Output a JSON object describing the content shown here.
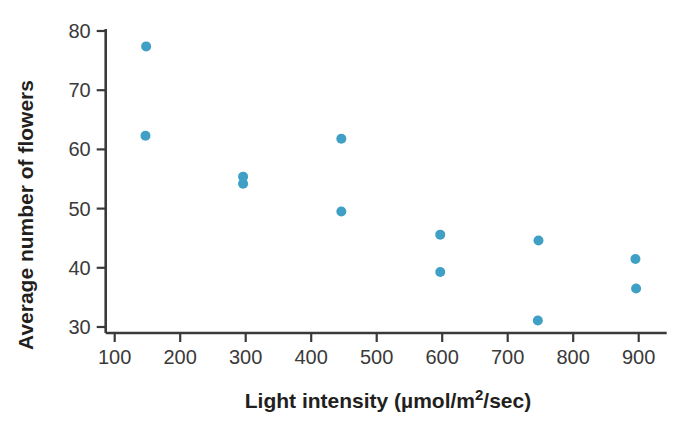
{
  "chart_data": {
    "type": "scatter",
    "title": "",
    "xlabel": "Light intensity (µmol/m²/sec)",
    "xlabel_parts": {
      "before": "Light intensity (µmol/m",
      "superscript": "2",
      "after": "/sec)"
    },
    "ylabel": "Average number of flowers",
    "xlim": [
      70,
      960
    ],
    "ylim": [
      27,
      82
    ],
    "xticks": [
      100,
      200,
      300,
      400,
      500,
      600,
      700,
      800,
      900
    ],
    "yticks": [
      30,
      40,
      50,
      60,
      70,
      80
    ],
    "xtick_labels": [
      "100",
      "200",
      "300",
      "400",
      "500",
      "600",
      "700",
      "800",
      "900"
    ],
    "ytick_labels": [
      "30",
      "40",
      "50",
      "60",
      "70",
      "80"
    ],
    "grid": false,
    "legend": false,
    "marker_color": "#3f9fc4",
    "marker_radius": 5,
    "axis_color": "#3a3a3a",
    "points": [
      {
        "x": 148,
        "y": 77.4
      },
      {
        "x": 147,
        "y": 62.3
      },
      {
        "x": 296,
        "y": 55.4
      },
      {
        "x": 296,
        "y": 54.2
      },
      {
        "x": 446,
        "y": 61.8
      },
      {
        "x": 446,
        "y": 49.5
      },
      {
        "x": 597,
        "y": 45.6
      },
      {
        "x": 597,
        "y": 39.3
      },
      {
        "x": 747,
        "y": 44.6
      },
      {
        "x": 746,
        "y": 31.1
      },
      {
        "x": 895,
        "y": 41.5
      },
      {
        "x": 896,
        "y": 36.5
      }
    ]
  }
}
